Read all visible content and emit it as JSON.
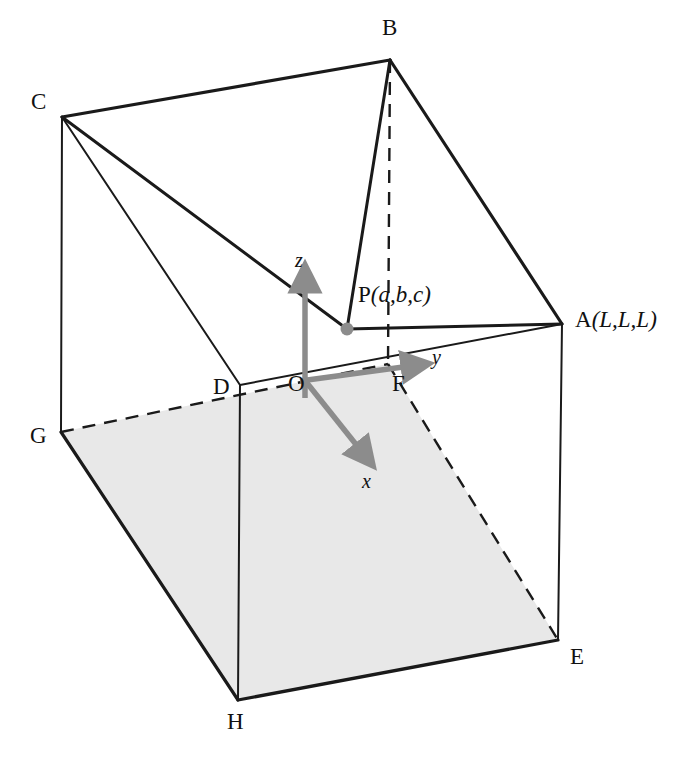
{
  "figure": {
    "kind": "3d-cube-geometry-diagram",
    "background_color": "#ffffff",
    "line_color": "#1a1a1a",
    "axis_color": "#8c8c8c",
    "shaded_face_color": "#e8e8e8",
    "shaded_face_name": "OFEH-bottom-face"
  },
  "vertices": {
    "A": {
      "label_text": "A(L,L,L)",
      "letter": "A",
      "coords_text": "(L,L,L)",
      "x": 562,
      "y": 324,
      "label_x": 575,
      "label_y": 308
    },
    "B": {
      "label_text": "B",
      "x": 390,
      "y": 60,
      "label_x": 382,
      "label_y": 16
    },
    "C": {
      "label_text": "C",
      "x": 62,
      "y": 117,
      "label_x": 31,
      "label_y": 90
    },
    "D": {
      "label_text": "D",
      "x": 240,
      "y": 385,
      "label_x": 213,
      "label_y": 375
    },
    "E": {
      "label_text": "E",
      "x": 558,
      "y": 640,
      "label_x": 570,
      "label_y": 645
    },
    "F": {
      "label_text": "F",
      "x": 388,
      "y": 364,
      "label_x": 392,
      "label_y": 372
    },
    "G": {
      "label_text": "G",
      "x": 61,
      "y": 432,
      "label_x": 30,
      "label_y": 424
    },
    "H": {
      "label_text": "H",
      "x": 238,
      "y": 700,
      "label_x": 227,
      "label_y": 710
    },
    "O": {
      "label_text": "O",
      "x": 305,
      "y": 382,
      "label_x": 288,
      "label_y": 372
    },
    "P": {
      "label_text": "P(a,b,c)",
      "letter": "P",
      "coords_text": "(a,b,c)",
      "x": 347,
      "y": 329,
      "label_x": 358,
      "label_y": 283
    }
  },
  "axes": [
    {
      "name": "z",
      "label": "z",
      "label_x": 295,
      "label_y": 250,
      "from_x": 305,
      "from_y": 382,
      "to_x": 305,
      "to_y": 272
    },
    {
      "name": "y",
      "label": "y",
      "label_x": 432,
      "label_y": 347,
      "from_x": 305,
      "from_y": 382,
      "to_x": 424,
      "to_y": 365
    },
    {
      "name": "x",
      "label": "x",
      "label_x": 362,
      "label_y": 471,
      "from_x": 305,
      "from_y": 382,
      "to_x": 372,
      "to_y": 464
    }
  ],
  "edges": {
    "solid": [
      "C-B",
      "B-A",
      "C-D",
      "A-E",
      "D-H",
      "G-H",
      "H-E",
      "C-G",
      "G-D-dashed",
      "D-O-F-A-top"
    ],
    "dashed": [
      "B-F vertical",
      "D-O-F",
      "G-D",
      "F-E"
    ],
    "construction": [
      "C-P",
      "B-P",
      "P-A",
      "C-A-diagonal"
    ]
  }
}
